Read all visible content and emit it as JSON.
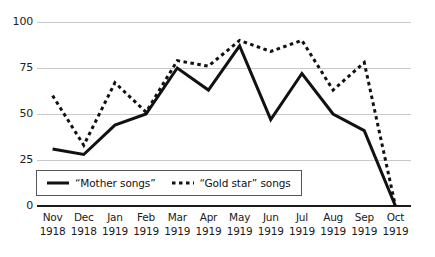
{
  "chart_data": {
    "type": "line",
    "title": "",
    "subtitle": "",
    "xlabel": "",
    "ylabel": "",
    "ylim": [
      0,
      100
    ],
    "yticks": [
      0,
      25,
      50,
      75,
      100
    ],
    "grid": true,
    "legend_position": "inside-bottom-left",
    "categories": [
      "Nov 1918",
      "Dec 1918",
      "Jan 1919",
      "Feb 1919",
      "Mar 1919",
      "Apr 1919",
      "May 1919",
      "Jun 1919",
      "Jul 1919",
      "Aug 1919",
      "Sep 1919",
      "Oct 1919"
    ],
    "category_month": [
      "Nov",
      "Dec",
      "Jan",
      "Feb",
      "Mar",
      "Apr",
      "May",
      "Jun",
      "Jul",
      "Aug",
      "Sep",
      "Oct"
    ],
    "category_year": [
      "1918",
      "1918",
      "1919",
      "1919",
      "1919",
      "1919",
      "1919",
      "1919",
      "1919",
      "1919",
      "1919",
      "1919"
    ],
    "series": [
      {
        "name": "“Mother songs”",
        "style": "solid",
        "color": "#111111",
        "values": [
          31,
          28,
          44,
          50,
          75,
          63,
          87,
          47,
          72,
          50,
          41,
          0
        ]
      },
      {
        "name": "“Gold star” songs",
        "style": "dotted",
        "color": "#111111",
        "values": [
          60,
          33,
          67,
          51,
          79,
          76,
          90,
          84,
          90,
          63,
          78,
          0
        ]
      }
    ]
  },
  "axes": {
    "y_tick_labels": [
      "100",
      "75",
      "50",
      "25",
      "0"
    ],
    "gridline_color": "#c9c9c9",
    "zero_axis_color": "#1a1a1a"
  },
  "legend": {
    "entries": [
      {
        "label": "“Mother songs”",
        "style": "solid",
        "icon": "solid-line-swatch"
      },
      {
        "label": "“Gold star” songs",
        "style": "dotted",
        "icon": "dotted-line-swatch"
      }
    ]
  }
}
